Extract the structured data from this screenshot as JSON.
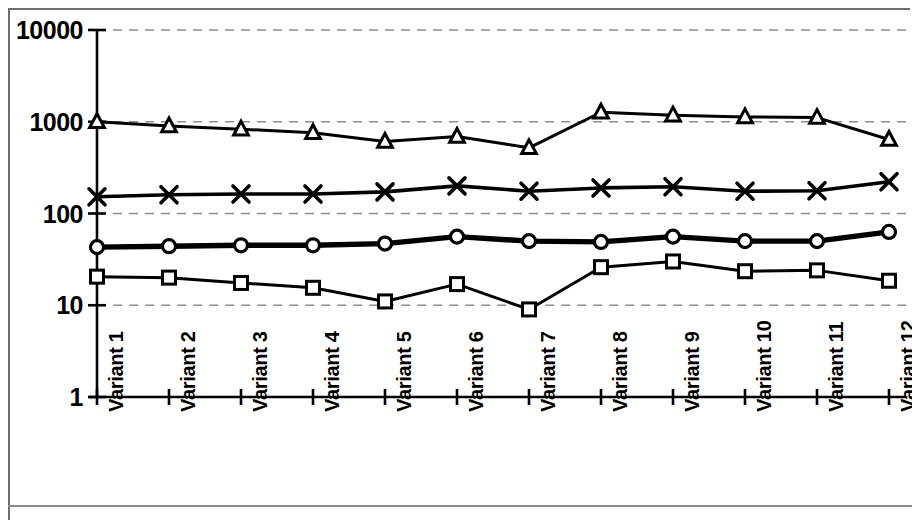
{
  "chart_data": {
    "type": "line",
    "title": "",
    "subtitle": "",
    "xlabel": "",
    "ylabel": "",
    "yscale": "log",
    "ylim": [
      1,
      10000
    ],
    "ytick_labels": [
      "10000",
      "1000",
      "100",
      "10",
      "1"
    ],
    "ytick_values": [
      10000,
      1000,
      100,
      10,
      1
    ],
    "grid": "horizontal-dashed",
    "legend": "none",
    "legend_position": "none",
    "categories": [
      "Variant 1",
      "Variant 2",
      "Variant 3",
      "Variant 4",
      "Variant 5",
      "Variant 6",
      "Variant 7",
      "Variant 8",
      "Variant 9",
      "Variant 10",
      "Variant 11",
      "Variant 12"
    ],
    "series": [
      {
        "name": "Series 1",
        "marker": "triangle",
        "values": [
          1000,
          900,
          830,
          760,
          610,
          690,
          520,
          1270,
          1180,
          1130,
          1110,
          640
        ]
      },
      {
        "name": "Series 2",
        "marker": "x",
        "values": [
          152,
          160,
          163,
          163,
          172,
          200,
          175,
          190,
          196,
          175,
          177,
          222
        ]
      },
      {
        "name": "Series 3",
        "marker": "circle",
        "values": [
          43,
          44,
          45,
          45,
          47,
          56,
          50,
          49,
          56,
          50,
          50,
          63
        ]
      },
      {
        "name": "Series 4",
        "marker": "square",
        "values": [
          20.5,
          20,
          17.5,
          15.5,
          11,
          17,
          9,
          26,
          30,
          23.5,
          24,
          18.5
        ]
      }
    ]
  },
  "axis": {
    "y_axis_name": "y-axis-log-scale",
    "x_axis_name": "x-axis-variants"
  }
}
